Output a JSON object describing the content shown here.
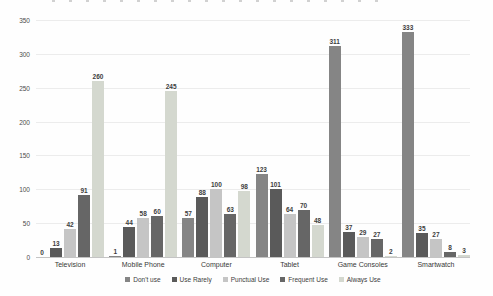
{
  "chart_data": {
    "type": "bar",
    "categories": [
      "Television",
      "Mobile Phone",
      "Computer",
      "Tablet",
      "Game Consoles",
      "Smartwatch"
    ],
    "series": [
      {
        "name": "Don't use",
        "color": "#858585",
        "values": [
          0,
          1,
          57,
          123,
          311,
          333
        ]
      },
      {
        "name": "Use Rarely",
        "color": "#5a5a5a",
        "values": [
          13,
          44,
          88,
          101,
          37,
          35
        ]
      },
      {
        "name": "Punctual Use",
        "color": "#c5c5c5",
        "values": [
          42,
          58,
          100,
          64,
          29,
          27
        ]
      },
      {
        "name": "Frequent Use",
        "color": "#666666",
        "values": [
          91,
          60,
          63,
          70,
          27,
          8
        ]
      },
      {
        "name": "Always Use",
        "color": "#d4d8cf",
        "values": [
          260,
          245,
          98,
          48,
          2,
          3
        ]
      }
    ],
    "ylim": [
      0,
      350
    ],
    "yticks": [
      0,
      50,
      100,
      150,
      200,
      250,
      300,
      350
    ],
    "grid": true,
    "legend_position": "bottom",
    "data_labels": true
  }
}
